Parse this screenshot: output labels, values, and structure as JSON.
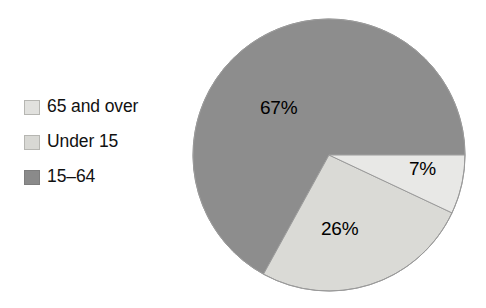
{
  "chart_data": {
    "type": "pie",
    "title": "",
    "subtitle": "",
    "xlabel": "",
    "ylabel": "",
    "legend_position": "left",
    "grid": false,
    "categories": [
      "65 and over",
      "Under 15",
      "15–64"
    ],
    "values": [
      7,
      26,
      67
    ],
    "value_labels": [
      "7%",
      "26%",
      "67%"
    ],
    "units": "percent",
    "slice_colors": [
      "#e8e8e6",
      "#dadad6",
      "#8d8d8d"
    ],
    "start_angle_deg": 0,
    "direction": "clockwise",
    "slices": [
      {
        "label": "65 and over",
        "value": 7,
        "value_label": "7%",
        "color": "#e8e8e6"
      },
      {
        "label": "Under 15",
        "value": 26,
        "value_label": "26%",
        "color": "#dadad6"
      },
      {
        "label": "15–64",
        "value": 67,
        "value_label": "67%",
        "color": "#8d8d8d"
      }
    ]
  },
  "legend": {
    "items": [
      {
        "label": "65 and over",
        "color": "#e1e1de"
      },
      {
        "label": "Under 15",
        "color": "#d8d8d4"
      },
      {
        "label": "15–64",
        "color": "#8a8a8a"
      }
    ]
  },
  "labels": {
    "slice_65_and_over": "7%",
    "slice_under_15": "26%",
    "slice_15_64": "67%"
  },
  "colors": {
    "outline": "#9a9a9a",
    "text": "#111111",
    "background": "#ffffff"
  }
}
